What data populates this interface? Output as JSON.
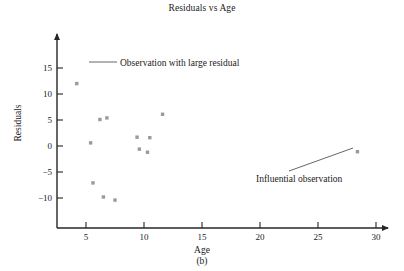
{
  "chart_data": {
    "type": "scatter",
    "title": "Residuals vs Age",
    "xlabel": "Age",
    "ylabel": "Residuals",
    "xlim": [
      3.5,
      32
    ],
    "ylim": [
      -12.5,
      16.5
    ],
    "xticks": [
      5,
      10,
      15,
      20,
      25,
      30
    ],
    "yticks": [
      -10,
      -5,
      0,
      5,
      10,
      15
    ],
    "xtick_labels": [
      "5",
      "10",
      "15",
      "20",
      "25",
      "30"
    ],
    "ytick_labels": [
      "−10",
      "−5",
      "0",
      "5",
      "10",
      "15"
    ],
    "grid": false,
    "legend": false,
    "x": [
      5.4,
      5.6,
      6.2,
      6.5,
      6.8,
      7.5,
      9.4,
      9.6,
      10.3,
      10.5,
      11.6,
      28.4
    ],
    "y": [
      0.6,
      -7.1,
      5.1,
      -9.8,
      5.4,
      -10.4,
      1.7,
      -0.6,
      -1.2,
      1.6,
      6.1,
      -1.1
    ],
    "points": [
      {
        "x": 5.4,
        "y": 0.6
      },
      {
        "x": 5.6,
        "y": -7.1
      },
      {
        "x": 6.2,
        "y": 5.1
      },
      {
        "x": 6.5,
        "y": -9.8
      },
      {
        "x": 6.8,
        "y": 5.4
      },
      {
        "x": 7.5,
        "y": -10.4
      },
      {
        "x": 9.4,
        "y": 1.7
      },
      {
        "x": 9.6,
        "y": -0.6
      },
      {
        "x": 10.3,
        "y": -1.2
      },
      {
        "x": 10.5,
        "y": 1.6
      },
      {
        "x": 11.6,
        "y": 6.1
      },
      {
        "x": 28.4,
        "y": -1.1
      }
    ],
    "annotations": [
      {
        "id": "large-residual",
        "text": "Observation with large residual",
        "marker_x": 4.2,
        "marker_y": 12.0
      },
      {
        "id": "influential-observation",
        "text": "Influential observation",
        "target_x": 28.4,
        "target_y": -1.1
      }
    ]
  },
  "figure": {
    "caption": "(b)"
  }
}
